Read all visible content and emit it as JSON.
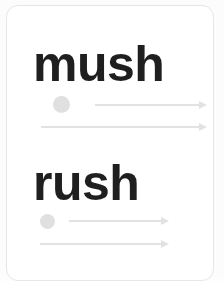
{
  "card": {
    "background_color": "#ffffff",
    "border_color": "#e6e6e6"
  },
  "page_background_color": "#fcfcfc",
  "accent": {
    "text_color": "#1f1f1f",
    "line_color": "#e2e2e2",
    "dot_color": "#e0e0e0"
  },
  "rows": [
    {
      "word": "mush",
      "marker": "dot",
      "arrows": [
        {
          "label": "arrow-right",
          "length": 112
        },
        {
          "label": "arrow-right",
          "length": 166
        }
      ]
    },
    {
      "word": "rush",
      "marker": "dot",
      "arrows": [
        {
          "label": "arrow-right",
          "length": 100
        },
        {
          "label": "arrow-right",
          "length": 129
        }
      ]
    }
  ]
}
